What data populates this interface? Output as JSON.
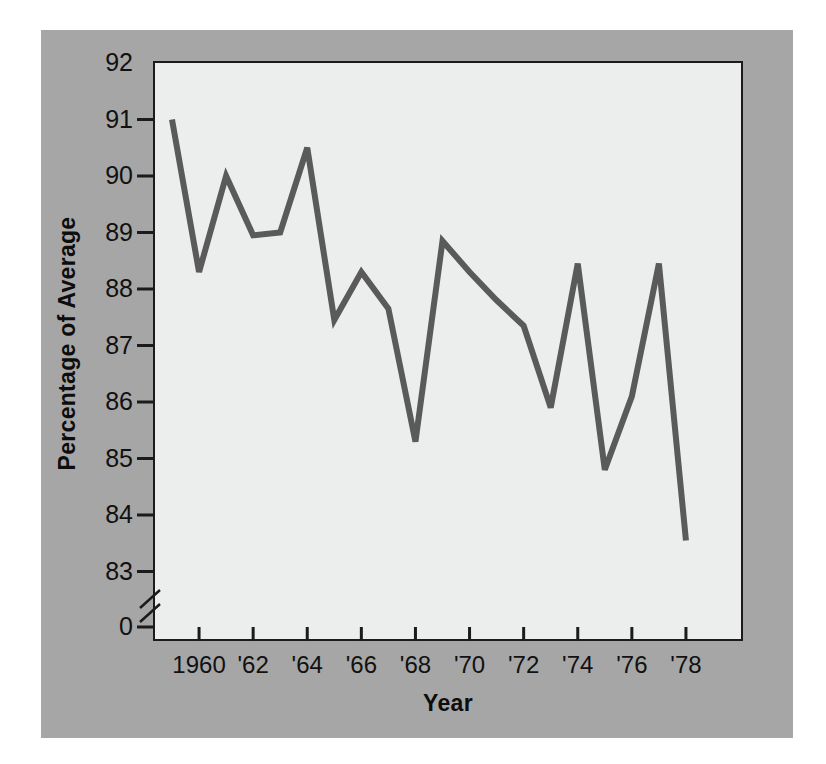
{
  "figure": {
    "background_color": "#ffffff",
    "panel_color": "#a6a6a6",
    "plot_background_color": "#eceded",
    "axis_color": "#1b1b1b",
    "line_color": "#5a5a5a"
  },
  "chart_data": {
    "type": "line",
    "title": "",
    "xlabel": "Year",
    "ylabel": "Percentage of Average",
    "xlim": [
      1958.5,
      1978.8
    ],
    "ylim": [
      82.7,
      92
    ],
    "grid": false,
    "legend": null,
    "axis_break": {
      "axis": "y",
      "between": [
        0,
        83
      ],
      "note": "zig-zag break mark between 0 and 83 on the y-axis"
    },
    "ytick_labels": [
      "92",
      "91",
      "90",
      "89",
      "88",
      "87",
      "86",
      "85",
      "84",
      "83",
      "0"
    ],
    "yticks": [
      92,
      91,
      90,
      89,
      88,
      87,
      86,
      85,
      84,
      83,
      0
    ],
    "xtick_labels": [
      "1960",
      "'62",
      "'64",
      "'66",
      "'68",
      "'70",
      "'72",
      "'74",
      "'76",
      "'78"
    ],
    "xticks": [
      1960,
      1962,
      1964,
      1966,
      1968,
      1970,
      1972,
      1974,
      1976,
      1978
    ],
    "x": [
      1959,
      1960,
      1961,
      1962,
      1963,
      1964,
      1965,
      1966,
      1967,
      1968,
      1969,
      1970,
      1971,
      1972,
      1973,
      1974,
      1975,
      1976,
      1977,
      1978
    ],
    "values": [
      91.0,
      88.3,
      90.0,
      88.95,
      89.0,
      90.5,
      87.45,
      88.3,
      87.65,
      85.3,
      88.85,
      88.3,
      87.8,
      87.35,
      85.9,
      88.45,
      84.8,
      86.1,
      88.45,
      83.55
    ],
    "series": [
      {
        "name": "Percentage of Average",
        "values": [
          91.0,
          88.3,
          90.0,
          88.95,
          89.0,
          90.5,
          87.45,
          88.3,
          87.65,
          85.3,
          88.85,
          88.3,
          87.8,
          87.35,
          85.9,
          88.45,
          84.8,
          86.1,
          88.45,
          83.55
        ]
      }
    ]
  }
}
